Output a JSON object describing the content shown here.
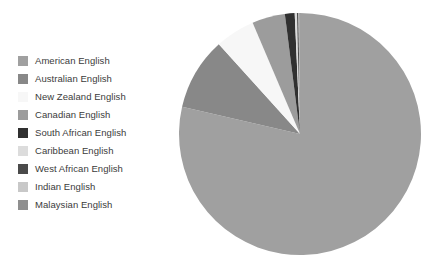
{
  "chart_data": {
    "type": "pie",
    "title": "",
    "subtitle": "",
    "xlabel": "",
    "ylabel": "",
    "grid": false,
    "legend_position": "left",
    "start_angle_deg": 0,
    "direction": "clockwise",
    "categories": [
      "American English",
      "Australian English",
      "New Zealand English",
      "Canadian English",
      "South African English",
      "Caribbean English",
      "West African English",
      "Indian English",
      "Malaysian English"
    ],
    "values": [
      78.6,
      9.7,
      5.3,
      4.4,
      1.3,
      0.3,
      0.2,
      0.1,
      0.1
    ],
    "colors": [
      "#a0a0a0",
      "#888888",
      "#f7f7f7",
      "#9c9c9c",
      "#303030",
      "#dcdcdc",
      "#4a4a4a",
      "#c8c8c8",
      "#8f8f8f"
    ],
    "slices": [
      {
        "label": "American English",
        "value": 78.6,
        "color": "#a0a0a0"
      },
      {
        "label": "Australian English",
        "value": 9.7,
        "color": "#888888"
      },
      {
        "label": "New Zealand English",
        "value": 5.3,
        "color": "#f7f7f7"
      },
      {
        "label": "Canadian English",
        "value": 4.4,
        "color": "#9c9c9c"
      },
      {
        "label": "South African English",
        "value": 1.3,
        "color": "#303030"
      },
      {
        "label": "Caribbean English",
        "value": 0.3,
        "color": "#dcdcdc"
      },
      {
        "label": "West African English",
        "value": 0.2,
        "color": "#4a4a4a"
      },
      {
        "label": "Indian English",
        "value": 0.1,
        "color": "#c8c8c8"
      },
      {
        "label": "Malaysian English",
        "value": 0.1,
        "color": "#8f8f8f"
      }
    ]
  },
  "legend": {
    "items": [
      {
        "label": "American English",
        "color": "#a0a0a0"
      },
      {
        "label": "Australian English",
        "color": "#888888"
      },
      {
        "label": "New Zealand English",
        "color": "#f7f7f7"
      },
      {
        "label": "Canadian English",
        "color": "#9c9c9c"
      },
      {
        "label": "South African English",
        "color": "#303030"
      },
      {
        "label": "Caribbean English",
        "color": "#dcdcdc"
      },
      {
        "label": "West African English",
        "color": "#4a4a4a"
      },
      {
        "label": "Indian English",
        "color": "#c8c8c8"
      },
      {
        "label": "Malaysian English",
        "color": "#8f8f8f"
      }
    ]
  },
  "geometry": {
    "center_x": 122,
    "center_y": 122,
    "radius": 121
  }
}
